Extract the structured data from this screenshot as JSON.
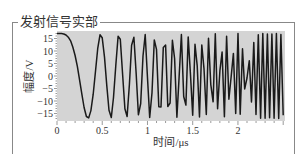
{
  "panel": {
    "title": "发射信号实部"
  },
  "chart_data": {
    "type": "line",
    "title": "发射信号实部",
    "xlabel": "时间/μs",
    "ylabel": "幅度/V",
    "xlim": [
      0,
      2.52
    ],
    "ylim": [
      -18,
      18
    ],
    "x_ticks": [
      0,
      0.5,
      1,
      1.5,
      2
    ],
    "x_tick_labels": [
      "0",
      "0.5",
      "1",
      "1.5",
      "2"
    ],
    "y_ticks": [
      15,
      10,
      5,
      0,
      -5,
      -10,
      -15
    ],
    "y_tick_labels": [
      "15",
      "10",
      "5",
      "0",
      "−5",
      "−10",
      "−15"
    ],
    "grid": false,
    "background": "#d4d4d4",
    "line_color": "#1a1a1a",
    "series": [
      {
        "name": "real part of LFM transmit signal",
        "model": "A*cos(pi*k*t^2)",
        "amplitude": 17,
        "chirp_rate_MHz_per_us": 8.5,
        "sample_interval_us": 0.025,
        "duration_us": 2.5,
        "x": [
          0,
          0.025,
          0.05,
          0.075,
          0.1,
          0.125,
          0.15,
          0.175,
          0.2,
          0.225,
          0.25,
          0.275,
          0.3,
          0.325,
          0.35,
          0.375,
          0.4,
          0.425,
          0.45,
          0.475,
          0.5,
          0.525,
          0.55,
          0.575,
          0.6,
          0.625,
          0.65,
          0.675,
          0.7,
          0.725,
          0.75,
          0.775,
          0.8,
          0.825,
          0.85,
          0.875,
          0.9,
          0.925,
          0.95,
          0.975,
          1.0
        ],
        "values": [
          17,
          17,
          16.96,
          16.81,
          16.4,
          15.54,
          14.1,
          11.6,
          8.18,
          3.73,
          -1.66,
          -7.36,
          -12.58,
          -16.19,
          -16.75,
          -13.85,
          -7.29,
          1.87,
          10.94,
          16.5,
          15.31,
          7.55,
          -3.9,
          -13.7,
          -16.6,
          -8.6,
          4.2,
          15.9,
          14.7,
          0.7,
          -13.1,
          -16.2,
          -3.4,
          12.3,
          15.5,
          0.7,
          -15.5,
          -11.0,
          8.0,
          16.6,
          -0.8
        ]
      }
    ]
  }
}
